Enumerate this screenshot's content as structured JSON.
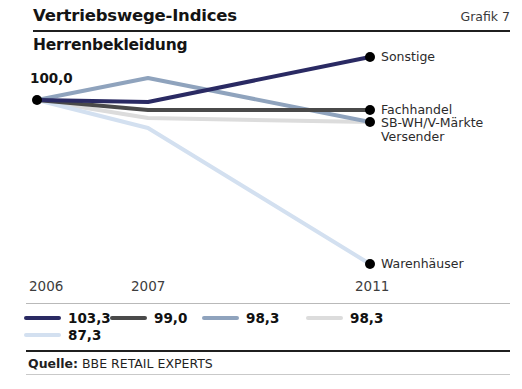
{
  "header": {
    "title": "Vertriebswege-Indices",
    "figure_number": "Grafik 7"
  },
  "subtitle": "Herrenbekleidung",
  "baseline_label": "100,0",
  "source": {
    "prefix": "Quelle:",
    "text": " BBE RETAIL EXPERTS"
  },
  "xaxis": {
    "ticks": [
      "2006",
      "2007",
      "2011"
    ]
  },
  "series_labels": {
    "sonstige": "Sonstige",
    "fachhandel": "Fachhandel",
    "sbwh": "SB-WH/V-Märkte",
    "versender": "Versender",
    "warenhaeuser": "Warenhäuser"
  },
  "legend": [
    {
      "value": "103,3",
      "color": "#2a2a63"
    },
    {
      "value": "99,0",
      "color": "#4a4a4a"
    },
    {
      "value": "98,3",
      "color": "#8fa3bd"
    },
    {
      "value": "98,3",
      "color": "#dcdcdc"
    },
    {
      "value": "87,3",
      "color": "#d3e0f0"
    }
  ],
  "colors": {
    "sonstige": "#2a2a63",
    "fachhandel": "#4a4a4a",
    "sbwh": "#8fa3bd",
    "versender": "#dcdcdc",
    "warenhaeuser": "#d3e0f0",
    "marker": "#111111",
    "rule_dark": "#1f1f1f",
    "rule_light": "#b9b9b9"
  },
  "chart_data": {
    "type": "line",
    "title": "Vertriebswege-Indices",
    "subtitle": "Herrenbekleidung",
    "xlabel": "",
    "ylabel": "Index (2006 = 100,0)",
    "x": [
      "2006",
      "2007",
      "2011"
    ],
    "grid": false,
    "legend_position": "bottom",
    "ylim": [
      85,
      104
    ],
    "baseline": 100.0,
    "annotations": [
      "100,0"
    ],
    "series": [
      {
        "name": "Sonstige",
        "values": [
          100.0,
          99.6,
          103.3
        ],
        "color": "#2a2a63",
        "end_label": "Sonstige"
      },
      {
        "name": "Fachhandel",
        "values": [
          100.0,
          98.6,
          99.0
        ],
        "color": "#4a4a4a",
        "end_label": "Fachhandel"
      },
      {
        "name": "SB-WH/V-Märkte",
        "values": [
          100.0,
          101.8,
          98.3
        ],
        "color": "#8fa3bd",
        "end_label": "SB-WH/V-Märkte"
      },
      {
        "name": "Versender",
        "values": [
          100.0,
          98.5,
          98.3
        ],
        "color": "#dcdcdc",
        "end_label": "Versender"
      },
      {
        "name": "Warenhäuser",
        "values": [
          100.0,
          97.6,
          87.3
        ],
        "color": "#d3e0f0",
        "end_label": "Warenhäuser"
      }
    ],
    "source": "Quelle: BBE RETAIL EXPERTS"
  }
}
